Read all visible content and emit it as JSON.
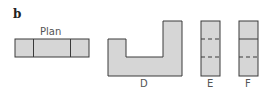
{
  "figure": {
    "panel_label": "b",
    "plan": {
      "label": "Plan"
    },
    "views": [
      {
        "id": "D",
        "label": "D"
      },
      {
        "id": "E",
        "label": "E"
      },
      {
        "id": "F",
        "label": "F"
      }
    ],
    "colors": {
      "fill": "#d6d6d6",
      "stroke": "#3a3a3a"
    }
  }
}
